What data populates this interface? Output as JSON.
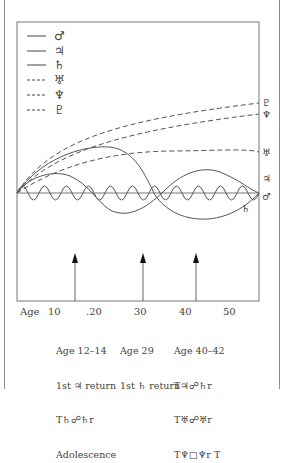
{
  "legend": [
    {
      "symbol": "♂",
      "name": "Mars",
      "style": "solid"
    },
    {
      "symbol": "♃",
      "name": "Jupiter",
      "style": "solid"
    },
    {
      "symbol": "♄",
      "name": "Saturn",
      "style": "solid"
    },
    {
      "symbol": "♅",
      "name": "Uranus",
      "style": "dashed"
    },
    {
      "symbol": "♆",
      "name": "Neptune",
      "style": "dashed"
    },
    {
      "symbol": "♇",
      "name": "Pluto",
      "style": "dashed"
    }
  ],
  "end_labels": {
    "pluto": "♇",
    "neptune": "♆",
    "uranus": "♅",
    "jupiter": "♃",
    "mars": "♂",
    "saturn": "♄"
  },
  "x_axis": {
    "label": "Age",
    "ticks": [
      "10",
      ".20",
      "30",
      "40",
      "50"
    ]
  },
  "markers": [
    {
      "age": 13,
      "lines": [
        "Age 12–14",
        "1st ♃ return",
        "T♄☍♄r",
        "Adolescence"
      ]
    },
    {
      "age": 29,
      "lines": [
        "Age 29",
        "1st ♄ return"
      ]
    },
    {
      "age": 41,
      "lines": [
        "Age 40–42",
        "T♃☍♄r",
        "T♅☍♅r",
        "T♆□♆r T"
      ]
    }
  ],
  "colors": {
    "line": "#555555",
    "frame": "#8a8a8a",
    "arrow": "#111111"
  }
}
